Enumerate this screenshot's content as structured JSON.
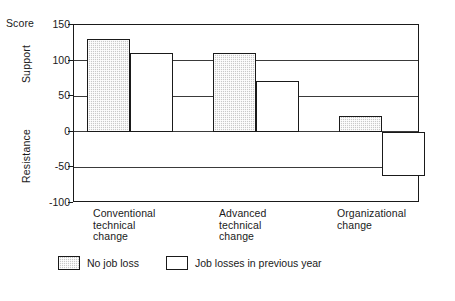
{
  "chart_data": {
    "type": "bar",
    "title": "",
    "xlabel": "",
    "ylabel": "Score",
    "ylim": [
      -100,
      150
    ],
    "yticks": [
      150,
      100,
      50,
      0,
      -50,
      -100
    ],
    "ytick_labels": [
      "150",
      "100",
      "50",
      "0",
      "-50",
      "-100"
    ],
    "grid": true,
    "axis_region_labels": {
      "top": "Support",
      "bottom": "Resistance",
      "unit": "Score"
    },
    "categories": [
      "Conventional\ntechnical\nchange",
      "Advanced\ntechnical\nchange",
      "Organizational\nchange"
    ],
    "series": [
      {
        "name": "No job loss",
        "fill": "shaded",
        "values": [
          130,
          110,
          22
        ]
      },
      {
        "name": "Job losses in previous year",
        "fill": "open",
        "values": [
          110,
          72,
          -62
        ]
      }
    ],
    "legend": {
      "position": "bottom",
      "entries": [
        {
          "label": "No job loss",
          "fill": "shaded"
        },
        {
          "label": "Job losses in previous year",
          "fill": "open"
        }
      ]
    },
    "colors": {
      "shaded_fill": "#c9c9c9",
      "open_fill": "#ffffff",
      "outline": "#1a1a1a",
      "gridline": "#3a3a3a",
      "background": "#ffffff"
    }
  }
}
